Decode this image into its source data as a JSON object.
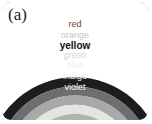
{
  "figure": {
    "panel_label": "(a)",
    "frame_border_color": "#9a9a9a",
    "background_color": "#ffffff"
  },
  "diagram": {
    "type": "rainbow-arc",
    "band_count": 7,
    "orientation": "arc opening downward",
    "bands": [
      {
        "index": 0,
        "label": "red",
        "position": "outermost",
        "fill": "#1d1d1d",
        "label_color": "#6a4540"
      },
      {
        "index": 1,
        "label": "orange",
        "position": "2",
        "fill": "#6e6e6e",
        "label_color": "#c8c3bd"
      },
      {
        "index": 2,
        "label": "yellow",
        "position": "3",
        "fill": "#a9a9a9",
        "label_color": "#111111"
      },
      {
        "index": 3,
        "label": "green",
        "position": "4",
        "fill": "#e4e4e0",
        "label_color": "#d6d6cc"
      },
      {
        "index": 4,
        "label": "blue",
        "position": "5",
        "fill": "#b2b2b2",
        "label_color": "#f0f0ee"
      },
      {
        "index": 5,
        "label": "indigo",
        "position": "6",
        "fill": "#767676",
        "label_color": "#f2f2f2"
      },
      {
        "index": 6,
        "label": "violet",
        "position": "innermost",
        "fill": "#1a1a1a",
        "label_color": "#fbfbfb"
      }
    ]
  }
}
